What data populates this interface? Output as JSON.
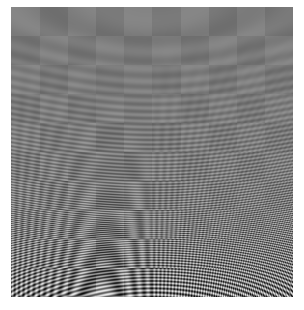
{
  "figure": {
    "frame": {
      "x": 11,
      "y": 7,
      "width": 282,
      "height": 290
    },
    "background": "#ffffff",
    "base_gray": "#7a7a7a",
    "blocks": {
      "cols": 10,
      "rows": 10
    },
    "max_frequency": 1.4
  }
}
